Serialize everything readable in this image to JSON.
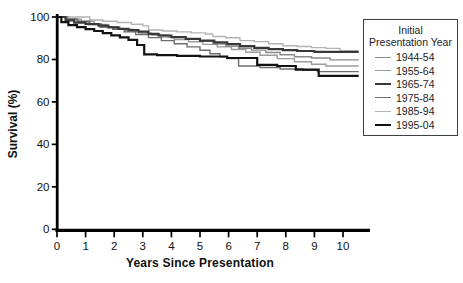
{
  "axes": {
    "x_label": "Years Since Presentation",
    "y_label": "Survival (%)"
  },
  "legend": {
    "title": "Initial Presentation Year"
  },
  "chart_data": {
    "type": "line",
    "subtype": "kaplan-meier-step",
    "title": "",
    "xlabel": "Years Since Presentation",
    "ylabel": "Survival (%)",
    "xlim": [
      0,
      10.8
    ],
    "ylim": [
      0,
      100
    ],
    "x_ticks": [
      0,
      1,
      2,
      3,
      4,
      5,
      6,
      7,
      8,
      9,
      10
    ],
    "y_ticks": [
      0,
      20,
      40,
      60,
      80,
      100
    ],
    "grid": false,
    "legend_title": "Initial Presentation Year",
    "legend_position": "outside-upper-right",
    "axis_color": "#000000",
    "draw_order": [
      4,
      1,
      0,
      3,
      2,
      5
    ],
    "series": [
      {
        "name": "1944-54",
        "color": "#8a8a8a",
        "width": 1.4,
        "points": [
          [
            0,
            100
          ],
          [
            0.35,
            98.8
          ],
          [
            0.75,
            97.7
          ],
          [
            1.1,
            96.3
          ],
          [
            1.5,
            95.2
          ],
          [
            1.95,
            94.4
          ],
          [
            2.4,
            93.5
          ],
          [
            2.85,
            92.4
          ],
          [
            3.3,
            91.5
          ],
          [
            3.9,
            90.4
          ],
          [
            4.5,
            89.5
          ],
          [
            5.0,
            88.5
          ],
          [
            5.45,
            87.3
          ],
          [
            5.9,
            86.2
          ],
          [
            6.35,
            85.3
          ],
          [
            6.8,
            84.4
          ],
          [
            7.3,
            83.3
          ],
          [
            7.8,
            82.2
          ],
          [
            8.3,
            81.3
          ],
          [
            8.9,
            80.7
          ],
          [
            9.55,
            79.8
          ],
          [
            10.55,
            79.8
          ]
        ]
      },
      {
        "name": "1955-64",
        "color": "#9c9c9c",
        "width": 1.4,
        "points": [
          [
            0,
            100
          ],
          [
            0.4,
            99.0
          ],
          [
            0.85,
            97.9
          ],
          [
            1.3,
            96.5
          ],
          [
            1.75,
            95.3
          ],
          [
            2.2,
            94.2
          ],
          [
            2.65,
            93.1
          ],
          [
            3.1,
            91.9
          ],
          [
            3.6,
            90.6
          ],
          [
            4.1,
            89.4
          ],
          [
            4.6,
            88.3
          ],
          [
            5.1,
            87.1
          ],
          [
            5.6,
            85.9
          ],
          [
            6.1,
            84.7
          ],
          [
            6.6,
            83.4
          ],
          [
            7.1,
            82.0
          ],
          [
            7.7,
            80.4
          ],
          [
            8.3,
            78.9
          ],
          [
            8.9,
            77.7
          ],
          [
            9.4,
            76.9
          ],
          [
            10.55,
            76.9
          ]
        ]
      },
      {
        "name": "1965-74",
        "color": "#383838",
        "width": 2.2,
        "points": [
          [
            0,
            100
          ],
          [
            0.3,
            98.4
          ],
          [
            0.6,
            97.3
          ],
          [
            1.0,
            96.7
          ],
          [
            1.45,
            95.9
          ],
          [
            1.8,
            95.1
          ],
          [
            2.15,
            94.4
          ],
          [
            2.5,
            93.8
          ],
          [
            2.85,
            93.1
          ],
          [
            3.2,
            92.1
          ],
          [
            3.55,
            91.3
          ],
          [
            4.0,
            90.5
          ],
          [
            4.5,
            89.7
          ],
          [
            5.0,
            88.9
          ],
          [
            5.5,
            88.1
          ],
          [
            5.95,
            87.2
          ],
          [
            6.4,
            86.3
          ],
          [
            6.9,
            85.5
          ],
          [
            7.4,
            84.9
          ],
          [
            7.9,
            84.4
          ],
          [
            8.4,
            84.0
          ],
          [
            9.0,
            83.6
          ],
          [
            10.55,
            83.6
          ]
        ]
      },
      {
        "name": "1975-84",
        "color": "#6e6e6e",
        "width": 1.4,
        "points": [
          [
            0,
            100
          ],
          [
            0.3,
            99.1
          ],
          [
            0.7,
            98.0
          ],
          [
            1.15,
            96.7
          ],
          [
            1.55,
            95.4
          ],
          [
            1.95,
            94.2
          ],
          [
            2.35,
            93.0
          ],
          [
            2.75,
            91.7
          ],
          [
            3.2,
            90.3
          ],
          [
            3.65,
            88.9
          ],
          [
            4.1,
            87.4
          ],
          [
            4.55,
            85.9
          ],
          [
            5.0,
            84.3
          ],
          [
            5.35,
            82.7
          ],
          [
            5.7,
            81.3
          ],
          [
            5.95,
            80.4
          ],
          [
            6.35,
            76.9
          ],
          [
            7.1,
            76.2
          ],
          [
            7.8,
            75.5
          ],
          [
            8.6,
            74.9
          ],
          [
            9.1,
            74.3
          ],
          [
            10.55,
            74.3
          ]
        ]
      },
      {
        "name": "1985-94",
        "color": "#b3b3b3",
        "width": 1.4,
        "points": [
          [
            0,
            100
          ],
          [
            1.15,
            98.6
          ],
          [
            1.6,
            98.0
          ],
          [
            2.1,
            97.4
          ],
          [
            2.6,
            96.6
          ],
          [
            3.0,
            95.8
          ],
          [
            3.2,
            93.9
          ],
          [
            3.7,
            93.4
          ],
          [
            4.2,
            93.0
          ],
          [
            4.7,
            92.5
          ],
          [
            5.2,
            92.0
          ],
          [
            5.45,
            90.8
          ],
          [
            5.9,
            90.2
          ],
          [
            6.4,
            88.9
          ],
          [
            6.9,
            88.4
          ],
          [
            7.4,
            87.4
          ],
          [
            7.9,
            86.5
          ],
          [
            8.4,
            86.1
          ],
          [
            8.9,
            85.6
          ],
          [
            9.4,
            85.2
          ],
          [
            9.9,
            84.0
          ],
          [
            10.55,
            84.0
          ]
        ]
      },
      {
        "name": "1995-04",
        "color": "#121212",
        "width": 2.2,
        "points": [
          [
            0,
            100
          ],
          [
            0.15,
            97.6
          ],
          [
            0.4,
            96.2
          ],
          [
            0.7,
            95.2
          ],
          [
            1.0,
            94.3
          ],
          [
            1.3,
            93.4
          ],
          [
            1.6,
            92.4
          ],
          [
            1.9,
            91.4
          ],
          [
            2.2,
            90.4
          ],
          [
            2.5,
            89.2
          ],
          [
            2.8,
            86.8
          ],
          [
            3.05,
            82.4
          ],
          [
            3.5,
            82.0
          ],
          [
            4.2,
            81.7
          ],
          [
            5.0,
            81.4
          ],
          [
            5.95,
            80.7
          ],
          [
            7.0,
            77.5
          ],
          [
            7.7,
            76.9
          ],
          [
            8.35,
            75.2
          ],
          [
            9.15,
            72.3
          ],
          [
            10.55,
            72.3
          ]
        ]
      }
    ]
  }
}
